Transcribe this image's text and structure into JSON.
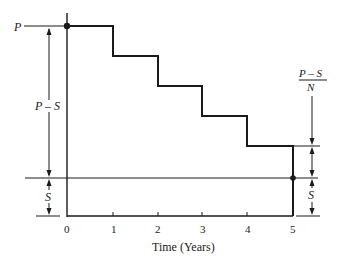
{
  "diagram": {
    "type": "step-depreciation",
    "y_labels": {
      "top": "P",
      "p_minus_s": "P – S",
      "s_left": "S",
      "s_right": "S",
      "fraction_numerator": "P – S",
      "fraction_denominator": "N"
    },
    "x_axis": {
      "label": "Time (Years)",
      "ticks": [
        "0",
        "1",
        "2",
        "3",
        "4",
        "5"
      ]
    },
    "steps": [
      {
        "year_start": 0,
        "year_end": 1,
        "level": "P"
      },
      {
        "year_start": 1,
        "year_end": 2,
        "level": "P - (P-S)/N"
      },
      {
        "year_start": 2,
        "year_end": 3,
        "level": "P - 2(P-S)/N"
      },
      {
        "year_start": 3,
        "year_end": 4,
        "level": "P - 3(P-S)/N"
      },
      {
        "year_start": 4,
        "year_end": 5,
        "level": "P - 4(P-S)/N"
      }
    ],
    "colors": {
      "line": "#1a1a1a",
      "background": "#ffffff"
    }
  }
}
